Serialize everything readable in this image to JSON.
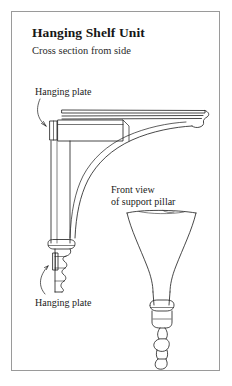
{
  "document": {
    "title": "Hanging Shelf Unit",
    "subtitle": "Cross section from side",
    "background_color": "#ffffff",
    "frame_color": "#9a9a9a",
    "ink_color": "#1a1a1a"
  },
  "labels": {
    "hanging_plate_top": "Hanging plate",
    "hanging_plate_bottom": "Hanging plate",
    "front_view_line1": "Front view",
    "front_view_line2": "of support pillar"
  },
  "drawing": {
    "type": "technical-line-drawing",
    "views": [
      {
        "name": "cross-section-from-side",
        "elements": [
          "shelf-top-board",
          "shelf-edge-moulding",
          "hanging-plate-upper",
          "vertical-support-pillar",
          "curved-bracket-brace",
          "turned-collar",
          "lower-finial",
          "hanging-plate-lower"
        ]
      },
      {
        "name": "front-view-of-support-pillar",
        "elements": [
          "flared-trumpet-body",
          "tapered-shaft",
          "turned-rings",
          "bottom-finial"
        ]
      }
    ]
  }
}
